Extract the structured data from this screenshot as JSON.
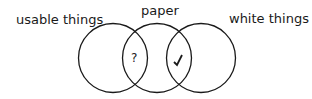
{
  "diagram": {
    "type": "venn",
    "sets": [
      {
        "label": "usable things"
      },
      {
        "label": "paper"
      },
      {
        "label": "white things"
      }
    ],
    "regions": {
      "usable_and_paper": "?",
      "paper_and_white": "✓"
    },
    "colors": {
      "stroke": "#1a1a1a",
      "background": "#ffffff"
    }
  }
}
